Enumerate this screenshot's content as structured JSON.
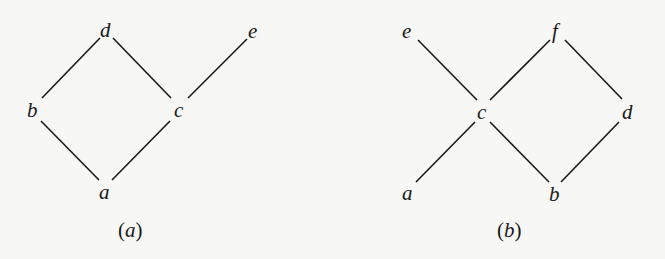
{
  "figures": [
    {
      "id": "a",
      "caption_open": "(",
      "caption_letter": "a",
      "caption_close": ")",
      "type": "hasse-diagram",
      "nodes": [
        {
          "id": "d",
          "label": "d"
        },
        {
          "id": "e",
          "label": "e"
        },
        {
          "id": "b",
          "label": "b"
        },
        {
          "id": "c",
          "label": "c"
        },
        {
          "id": "a",
          "label": "a"
        }
      ],
      "edges": [
        [
          "d",
          "b"
        ],
        [
          "d",
          "c"
        ],
        [
          "e",
          "c"
        ],
        [
          "b",
          "a"
        ],
        [
          "c",
          "a"
        ]
      ]
    },
    {
      "id": "b",
      "caption_open": "(",
      "caption_letter": "b",
      "caption_close": ")",
      "type": "hasse-diagram",
      "nodes": [
        {
          "id": "e",
          "label": "e"
        },
        {
          "id": "f",
          "label": "f"
        },
        {
          "id": "c",
          "label": "c"
        },
        {
          "id": "d",
          "label": "d"
        },
        {
          "id": "a",
          "label": "a"
        },
        {
          "id": "b",
          "label": "b"
        }
      ],
      "edges": [
        [
          "e",
          "c"
        ],
        [
          "f",
          "c"
        ],
        [
          "f",
          "d"
        ],
        [
          "c",
          "a"
        ],
        [
          "c",
          "b"
        ],
        [
          "d",
          "b"
        ]
      ]
    }
  ]
}
